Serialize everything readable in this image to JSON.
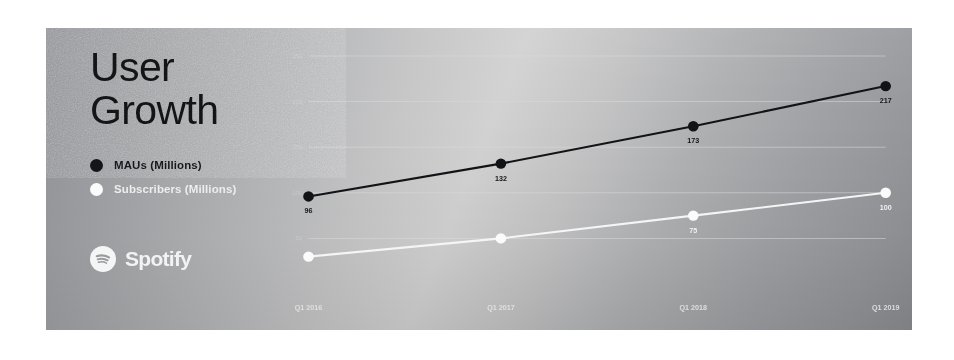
{
  "slide": {
    "title": "User\nGrowth",
    "brand_name": "Spotify",
    "brand_icon": "spotify-logo-icon",
    "background_note": "grayscale photographed slide with diagonal light gradient"
  },
  "legend": {
    "items": [
      {
        "label": "MAUs (Millions)",
        "color": "#121316",
        "marker": "filled-circle"
      },
      {
        "label": "Subscribers (Millions)",
        "color": "#fbfbfb",
        "marker": "filled-circle"
      }
    ]
  },
  "chart_data": {
    "type": "line",
    "title": "User Growth",
    "xlabel": "",
    "ylabel": "",
    "categories": [
      "Q1 2016",
      "Q1 2017",
      "Q1 2018",
      "Q1 2019"
    ],
    "series": [
      {
        "name": "MAUs (Millions)",
        "color": "#121316",
        "values": [
          96,
          132,
          173,
          217
        ],
        "point_labels": [
          "96",
          "132",
          "173",
          "217"
        ]
      },
      {
        "name": "Subscribers (Millions)",
        "color": "#fbfbfb",
        "values": [
          30,
          50,
          75,
          100
        ],
        "point_labels": [
          "",
          "",
          "75",
          "100"
        ]
      }
    ],
    "ylim": [
      0,
      250
    ],
    "yticks": [
      50,
      100,
      150,
      200,
      250
    ],
    "ytick_labels": [
      "50",
      "100",
      "150",
      "200",
      "250"
    ],
    "grid": true,
    "legend_position": "left-panel"
  }
}
